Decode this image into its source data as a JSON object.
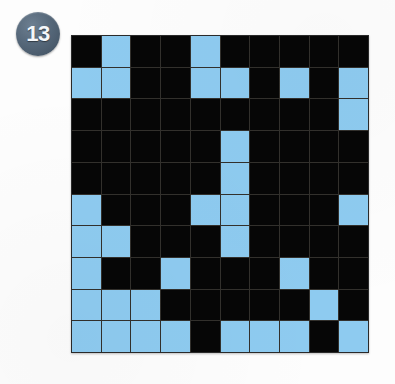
{
  "puzzle": {
    "badge_label": "13",
    "badge_name": "puzzle-number-badge",
    "colors": {
      "badge_fill": "#56687a",
      "badge_text": "#f4f7fa",
      "cell_dark": "#060606",
      "cell_light": "#8ecbf0",
      "grid_line": "#32302c",
      "page_background": "#fdfdfd"
    }
  },
  "chart_data": {
    "type": "heatmap",
    "title": "13",
    "xlabel": "",
    "ylabel": "",
    "rows": 10,
    "columns": 10,
    "legend": [
      {
        "value": 0,
        "label": "dark",
        "color": "#060606"
      },
      {
        "value": 1,
        "label": "light",
        "color": "#8ecbf0"
      }
    ],
    "grid": [
      [
        0,
        1,
        0,
        0,
        1,
        0,
        0,
        0,
        0,
        0
      ],
      [
        1,
        1,
        0,
        0,
        1,
        1,
        0,
        1,
        0,
        1
      ],
      [
        0,
        0,
        0,
        0,
        0,
        0,
        0,
        0,
        0,
        1
      ],
      [
        0,
        0,
        0,
        0,
        0,
        1,
        0,
        0,
        0,
        0
      ],
      [
        0,
        0,
        0,
        0,
        0,
        1,
        0,
        0,
        0,
        0
      ],
      [
        1,
        0,
        0,
        0,
        1,
        1,
        0,
        0,
        0,
        1
      ],
      [
        1,
        1,
        0,
        0,
        0,
        1,
        0,
        0,
        0,
        0
      ],
      [
        1,
        0,
        0,
        1,
        0,
        0,
        0,
        1,
        0,
        0
      ],
      [
        1,
        1,
        1,
        0,
        0,
        0,
        0,
        0,
        1,
        0
      ],
      [
        1,
        1,
        1,
        1,
        0,
        1,
        1,
        1,
        0,
        1
      ]
    ]
  }
}
